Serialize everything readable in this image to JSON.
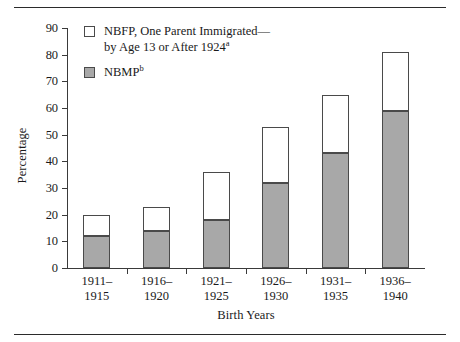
{
  "figure": {
    "y_axis_title": "Percentage",
    "x_axis_title": "Birth Years"
  },
  "legend": {
    "items": [
      {
        "swatch": "open-square-icon",
        "line1": "NBFP, One Parent Immigrated—",
        "line2": "by Age 13 or After 1924",
        "note": "a"
      },
      {
        "swatch": "filled-square-icon",
        "line1": "NBMP",
        "line2": "",
        "note": "b"
      }
    ]
  },
  "colors": {
    "nbmp_fill": "#a8a8a8",
    "nbfp_fill": "#ffffff",
    "bar_outline": "#4a4a4a",
    "axis": "#3a3a3a"
  },
  "chart_data": {
    "type": "bar",
    "stacked": true,
    "title": "",
    "xlabel": "Birth Years",
    "ylabel": "Percentage",
    "ylim": [
      0,
      90
    ],
    "ytick_step": 10,
    "yticks": [
      0,
      10,
      20,
      30,
      40,
      50,
      60,
      70,
      80,
      90
    ],
    "grid": false,
    "legend_position": "top-left-inside",
    "categories": [
      "1911–1915",
      "1916–1920",
      "1921–1925",
      "1926–1930",
      "1931–1935",
      "1936–1940"
    ],
    "categories_lines": [
      [
        "1911–",
        "1915"
      ],
      [
        "1916–",
        "1920"
      ],
      [
        "1921–",
        "1925"
      ],
      [
        "1926–",
        "1930"
      ],
      [
        "1931–",
        "1935"
      ],
      [
        "1936–",
        "1940"
      ]
    ],
    "series": [
      {
        "name": "NBMP",
        "values": [
          12,
          14,
          18,
          32,
          43,
          59
        ]
      },
      {
        "name": "NBFP, One Parent Immigrated—by Age 13 or After 1924",
        "values": [
          8,
          9,
          18,
          21,
          22,
          22
        ]
      }
    ],
    "totals": [
      20,
      23,
      36,
      53,
      65,
      81
    ]
  }
}
